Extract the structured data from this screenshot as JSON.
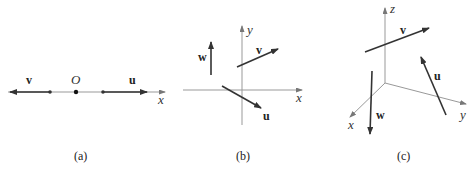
{
  "panels": [
    {
      "caption": "(a)",
      "labels": {
        "v": "v",
        "origin": "O",
        "u": "u",
        "x_axis": "x"
      }
    },
    {
      "caption": "(b)",
      "labels": {
        "w": "w",
        "v": "v",
        "u": "u",
        "x_axis": "x",
        "y_axis": "y"
      }
    },
    {
      "caption": "(c)",
      "labels": {
        "v": "v",
        "u": "u",
        "w": "w",
        "x_axis": "x",
        "y_axis": "y",
        "z_axis": "z"
      }
    }
  ],
  "colors": {
    "axis": "#888888",
    "vector": "#333333",
    "text": "#222222"
  }
}
